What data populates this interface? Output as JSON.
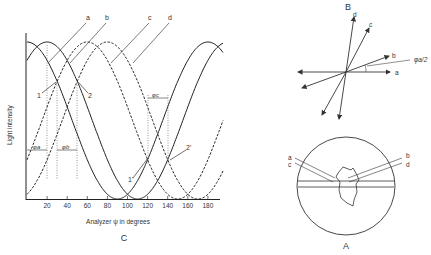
{
  "panel_c": {
    "label": "C",
    "xlabel": "Analyzer ψ in degrees",
    "ylabel": "Light intensity",
    "x_ticks": [
      "20",
      "40",
      "60",
      "80",
      "100",
      "120",
      "140",
      "160",
      "180"
    ],
    "curve_labels": [
      "a",
      "b",
      "c",
      "d"
    ],
    "point_labels": [
      "1",
      "2",
      "1'",
      "2'"
    ],
    "phi_labels": [
      "φa",
      "φb",
      "φc"
    ]
  },
  "panel_b": {
    "label": "B",
    "vector_labels": [
      "a",
      "b",
      "c",
      "d"
    ],
    "angle_label": "φa/2"
  },
  "panel_a": {
    "label": "A",
    "labels": [
      "a",
      "b",
      "c",
      "d"
    ]
  },
  "chart_data": {
    "type": "line",
    "title": "",
    "xlabel": "Analyzer ψ in degrees",
    "ylabel": "Light intensity",
    "x_ticks": [
      20,
      40,
      60,
      80,
      100,
      120,
      140,
      160,
      180
    ],
    "xlim": [
      0,
      195
    ],
    "grid": false,
    "series": [
      {
        "name": "a",
        "style": "solid",
        "function": "cos^2",
        "peaks_deg": [
          0,
          180
        ],
        "minimum_deg": 90
      },
      {
        "name": "b",
        "style": "solid",
        "function": "cos^2",
        "peaks_deg": [
          20,
          200
        ],
        "minimum_deg": 110
      },
      {
        "name": "c",
        "style": "dashed",
        "function": "cos^2",
        "peaks_deg": [
          60
        ],
        "minimum_deg": 150
      },
      {
        "name": "d",
        "style": "dashed",
        "function": "cos^2",
        "peaks_deg": [
          80
        ],
        "minimum_deg": 170
      }
    ],
    "annotations": [
      {
        "label": "1",
        "at_deg": 45
      },
      {
        "label": "2",
        "at_deg": 65
      },
      {
        "label": "1'",
        "at_deg": 120
      },
      {
        "label": "2'",
        "at_deg": 140
      }
    ]
  }
}
